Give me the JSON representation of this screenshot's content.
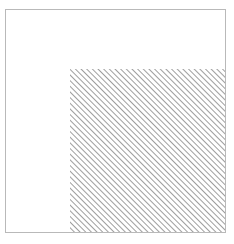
{
  "figure": {
    "canvas": {
      "width": 234,
      "height": 244,
      "background_color": "#ffffff"
    },
    "outer_rect": {
      "name": "outer-square",
      "x": 5,
      "y": 9,
      "width": 221,
      "height": 224,
      "stroke_color": "#b9b9b9",
      "stroke_width": 1,
      "fill_color": "#ffffff"
    },
    "hatched_rect": {
      "name": "hatched-region",
      "x": 70,
      "y": 69,
      "width": 156,
      "height": 164,
      "fill_color": "#ffffff",
      "hatch_color": "#9e9e9e",
      "hatch_angle_degrees": 45,
      "hatch_spacing_px": 4,
      "hatch_line_width": 1,
      "hatch_direction": "forward-slash"
    },
    "clear_region": {
      "name": "unhatched-region",
      "description": "inverted-L shaped white area along top and left of outer square",
      "fill_color": "#ffffff"
    },
    "labels": {
      "outer_rect_label": "",
      "hatched_rect_label": "",
      "caption": ""
    }
  }
}
